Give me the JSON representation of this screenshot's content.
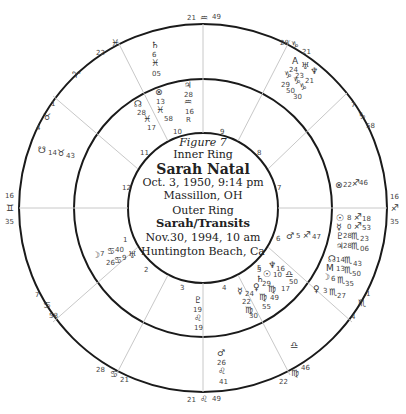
{
  "center": {
    "figure": "Figure 7",
    "inner_ring_title": "Inner Ring",
    "inner_name": "Sarah Natal",
    "inner_date": "Oct. 3, 1950, 9:14 pm",
    "inner_place": "Massillon, OH",
    "outer_ring_title": "Outer Ring",
    "outer_name": "Sarah/Transits",
    "outer_date": "Nov.30, 1994, 10 am",
    "outer_place": "Huntington Beach, Ca"
  },
  "house_numbers": [
    "1",
    "2",
    "3",
    "4",
    "5",
    "6",
    "7",
    "8",
    "9",
    "10",
    "11",
    "12"
  ],
  "outer_cusps": [
    {
      "pos": "top",
      "deg": "21",
      "sign": "♒",
      "min": "49"
    },
    {
      "pos": "bottom",
      "deg": "21",
      "sign": "♌",
      "min": "49"
    },
    {
      "pos": "left",
      "deg": "16",
      "sign": "♊",
      "min": "35"
    },
    {
      "pos": "right",
      "deg": "16",
      "sign": "♐",
      "min": "35"
    },
    {
      "pos": "upper-left-1",
      "deg": "22",
      "sign": "♓",
      "min": ""
    },
    {
      "pos": "upper-left-2",
      "deg": "1",
      "sign": "♉",
      "min": "4"
    },
    {
      "pos": "upper-right-1",
      "deg": "28",
      "sign": "♑",
      "min": "21"
    },
    {
      "pos": "upper-right-2",
      "deg": "7",
      "sign": "♑",
      "min": "58"
    },
    {
      "pos": "lower-left-1",
      "deg": "7",
      "sign": "♋",
      "min": "58"
    },
    {
      "pos": "lower-left-2",
      "deg": "28",
      "sign": "♋",
      "min": "21"
    },
    {
      "pos": "lower-right-1",
      "deg": "1",
      "sign": "♏",
      "min": "4"
    },
    {
      "pos": "lower-right-2",
      "deg": "22",
      "sign": "♍",
      "min": "46"
    }
  ],
  "outer_signs": {
    "aries": "♈",
    "libra": "♎"
  },
  "transit_planets": [
    {
      "glyph": "♄",
      "deg": "6",
      "sign": "♓",
      "min": "05"
    },
    {
      "glyph": "☋",
      "deg": "14",
      "sign": "♉",
      "min": "43"
    },
    {
      "glyph": "♂",
      "deg": "26",
      "sign": "♌",
      "min": "41"
    },
    {
      "glyph": "⊗",
      "deg": "22",
      "sign": "♐",
      "min": "46"
    },
    {
      "glyph": "☉",
      "deg": "8",
      "sign": "♐",
      "min": "18"
    },
    {
      "glyph": "☿",
      "deg": "0",
      "sign": "♐",
      "min": "53"
    },
    {
      "glyph": "♇",
      "deg": "28",
      "sign": "♏",
      "min": "23"
    },
    {
      "glyph": "♃",
      "deg": "28",
      "sign": "♏",
      "min": "06"
    },
    {
      "glyph": "☊",
      "deg": "14",
      "sign": "♏",
      "min": "43"
    },
    {
      "glyph": "M",
      "deg": "13",
      "sign": "♏",
      "min": "50"
    },
    {
      "glyph": "☽",
      "deg": "6",
      "sign": "♏",
      "min": "35"
    },
    {
      "glyph": "♀",
      "deg": "3",
      "sign": "♏",
      "min": "27"
    },
    {
      "glyph": "A",
      "deg": "24",
      "sign": "♑",
      "min": "29"
    },
    {
      "glyph": "♅",
      "deg": "23",
      "sign": "♑",
      "min": "50"
    },
    {
      "glyph": "♆",
      "deg": "21",
      "sign": "♑",
      "min": "30"
    }
  ],
  "natal_planets": [
    {
      "glyph": "♃",
      "deg": "28",
      "sign": "♒",
      "min": "16",
      "retro": "R"
    },
    {
      "glyph": "⊗",
      "deg": "13",
      "sign": "♓",
      "min": "58"
    },
    {
      "glyph": "☊",
      "deg": "28",
      "sign": "♓",
      "min": "17"
    },
    {
      "glyph": "☽",
      "deg": "7",
      "sign": "♋",
      "min": "40"
    },
    {
      "glyph": "♅",
      "deg": "9",
      "sign": "♋",
      "min": "26"
    },
    {
      "glyph": "♇",
      "deg": "19",
      "sign": "♌",
      "min": "19"
    },
    {
      "glyph": "♂",
      "deg": "5",
      "sign": "♐",
      "min": "47"
    },
    {
      "glyph": "♆",
      "deg": "",
      "sign": "",
      "min": "5"
    },
    {
      "glyph": "☉",
      "deg": "10",
      "sign": "♎",
      "min": "16"
    },
    {
      "glyph": "♄",
      "deg": "",
      "sign": "♍",
      "min": "50"
    },
    {
      "glyph": "♀",
      "deg": "29",
      "sign": "♍",
      "min": "17"
    },
    {
      "glyph": "☿",
      "deg": "22",
      "sign": "♍",
      "min": "55"
    },
    {
      "glyph": "♄",
      "deg": "24",
      "sign": "♍",
      "min": "49"
    },
    {
      "glyph": "M",
      "deg": "17",
      "sign": "♍",
      "min": "30"
    }
  ],
  "colors": {
    "ring": "#1a1a1a",
    "spoke": "#c8c8c8",
    "text": "#333333"
  }
}
